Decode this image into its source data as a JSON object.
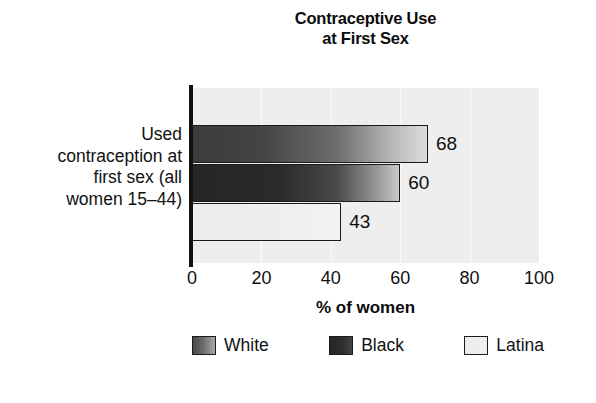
{
  "chart_data": {
    "type": "bar",
    "orientation": "horizontal",
    "title": "Contraceptive Use at First Sex",
    "title_lines": [
      "Contraceptive Use",
      "at First Sex"
    ],
    "categories": [
      "Used contraception at first sex (all women 15–44)"
    ],
    "category_label_lines": [
      "Used",
      "contraception at",
      "first sex (all",
      "women 15–44)"
    ],
    "series": [
      {
        "name": "White",
        "values": [
          68
        ],
        "color": "#6e6e6e"
      },
      {
        "name": "Black",
        "values": [
          60
        ],
        "color": "#2a2a2a"
      },
      {
        "name": "Latina",
        "values": [
          43
        ],
        "color": "#ececec"
      }
    ],
    "value_labels": [
      "68",
      "60",
      "43"
    ],
    "xlabel": "% of women",
    "ylabel": "",
    "xlim": [
      0,
      100
    ],
    "xticks": [
      "0",
      "20",
      "40",
      "60",
      "80",
      "100"
    ],
    "xtick_values": [
      0,
      20,
      40,
      60,
      80,
      100
    ],
    "grid": true,
    "grid_axis": "x",
    "legend_position": "bottom",
    "plot_background": "#eeeeee",
    "axis_color": "#111111"
  },
  "legend": {
    "items": [
      {
        "label": "White"
      },
      {
        "label": "Black"
      },
      {
        "label": "Latina"
      }
    ]
  },
  "caption": {
    "text": ""
  }
}
